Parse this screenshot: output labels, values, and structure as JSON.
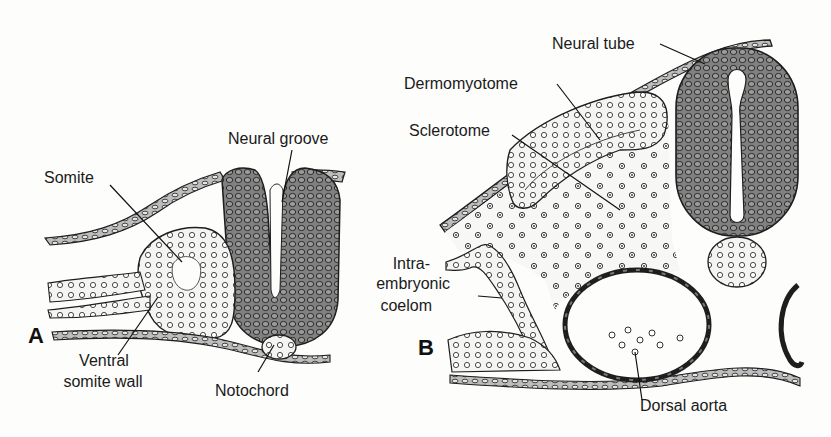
{
  "figure": {
    "panels": [
      {
        "id": "A",
        "label": "A",
        "labels": {
          "neural_groove": "Neural groove",
          "somite": "Somite",
          "ventral_somite_wall_line1": "Ventral",
          "ventral_somite_wall_line2": "somite wall",
          "notochord": "Notochord"
        }
      },
      {
        "id": "B",
        "label": "B",
        "labels": {
          "neural_tube": "Neural tube",
          "dermomyotome": "Dermomyotome",
          "sclerotome": "Sclerotome",
          "coelom_line1": "Intra-",
          "coelom_line2": "embryonic",
          "coelom_line3": "coelom",
          "dorsal_aorta": "Dorsal aorta"
        }
      }
    ],
    "colors": {
      "neural_tissue": "#7d7d7d",
      "outline": "#1e1e1e",
      "background": "#fdfdfc",
      "cell": "#3a3a3a"
    }
  }
}
